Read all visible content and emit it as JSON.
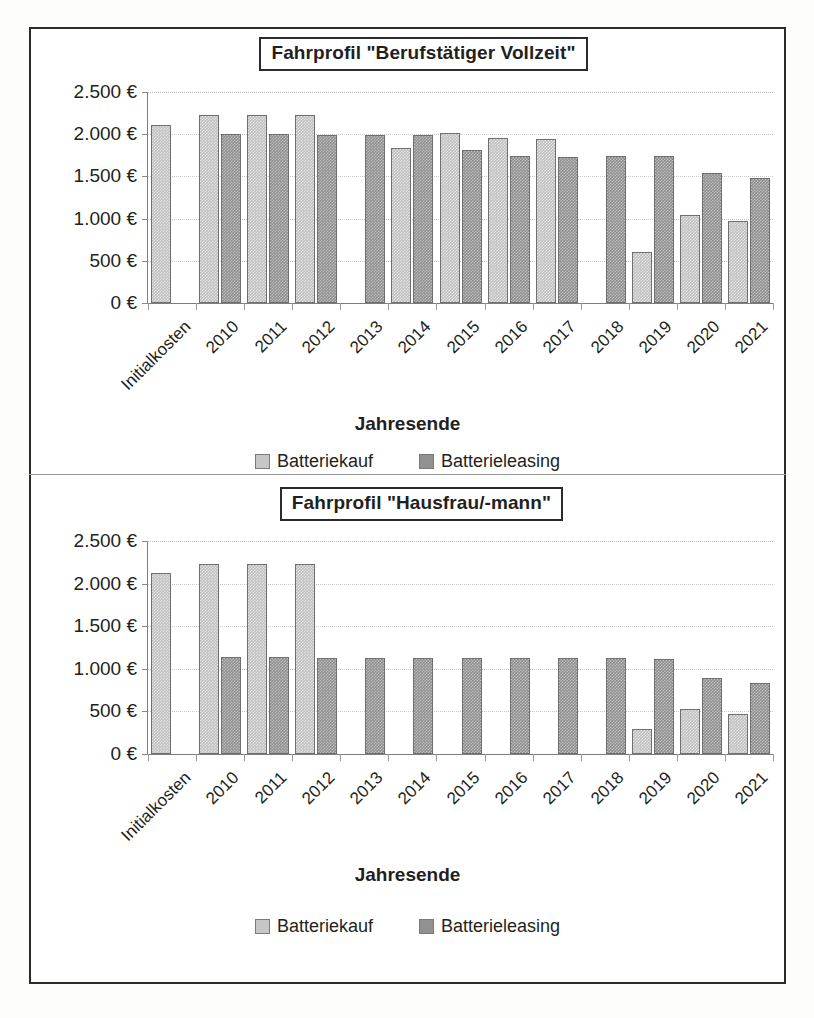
{
  "document": {
    "kind": "scanned-figure",
    "legend_labels": {
      "kauf": "Batteriekauf",
      "leasing": "Batterieleasing"
    },
    "axis_title": "Jahresende"
  },
  "chart_data": [
    {
      "type": "bar",
      "title": "Fahrprofil \"Berufstätiger Vollzeit\"",
      "xlabel": "Jahresende",
      "ylabel": "",
      "ylim": [
        0,
        2500
      ],
      "yticks": [
        0,
        500,
        1000,
        1500,
        2000,
        2500
      ],
      "ytick_labels": [
        "0 €",
        "500 €",
        "1.000 €",
        "1.500 €",
        "2.000 €",
        "2.500 €"
      ],
      "grid": true,
      "legend_position": "bottom",
      "categories": [
        "Initialkosten",
        "2010",
        "2011",
        "2012",
        "2013",
        "2014",
        "2015",
        "2016",
        "2017",
        "2018",
        "2019",
        "2020",
        "2021"
      ],
      "series": [
        {
          "name": "Batteriekauf",
          "color": "#c6c6c6",
          "values": [
            2110,
            2230,
            2230,
            2225,
            null,
            1840,
            2010,
            1950,
            1940,
            null,
            610,
            1040,
            970
          ]
        },
        {
          "name": "Batterieleasing",
          "color": "#919191",
          "values": [
            null,
            2000,
            2000,
            1995,
            1990,
            1990,
            1810,
            1745,
            1735,
            1740,
            1740,
            1540,
            1480
          ]
        }
      ]
    },
    {
      "type": "bar",
      "title": "Fahrprofil \"Hausfrau/-mann\"",
      "xlabel": "Jahresende",
      "ylabel": "",
      "ylim": [
        0,
        2500
      ],
      "yticks": [
        0,
        500,
        1000,
        1500,
        2000,
        2500
      ],
      "ytick_labels": [
        "0 €",
        "500 €",
        "1.000 €",
        "1.500 €",
        "2.000 €",
        "2.500 €"
      ],
      "grid": true,
      "legend_position": "bottom",
      "categories": [
        "Initialkosten",
        "2010",
        "2011",
        "2012",
        "2013",
        "2014",
        "2015",
        "2016",
        "2017",
        "2018",
        "2019",
        "2020",
        "2021"
      ],
      "series": [
        {
          "name": "Batteriekauf",
          "color": "#c6c6c6",
          "values": [
            2120,
            2230,
            2225,
            2225,
            null,
            null,
            null,
            null,
            null,
            null,
            290,
            530,
            470
          ]
        },
        {
          "name": "Batterieleasing",
          "color": "#919191",
          "values": [
            null,
            1135,
            1135,
            1130,
            1130,
            1130,
            1130,
            1130,
            1125,
            1125,
            1120,
            890,
            830
          ]
        }
      ]
    }
  ]
}
